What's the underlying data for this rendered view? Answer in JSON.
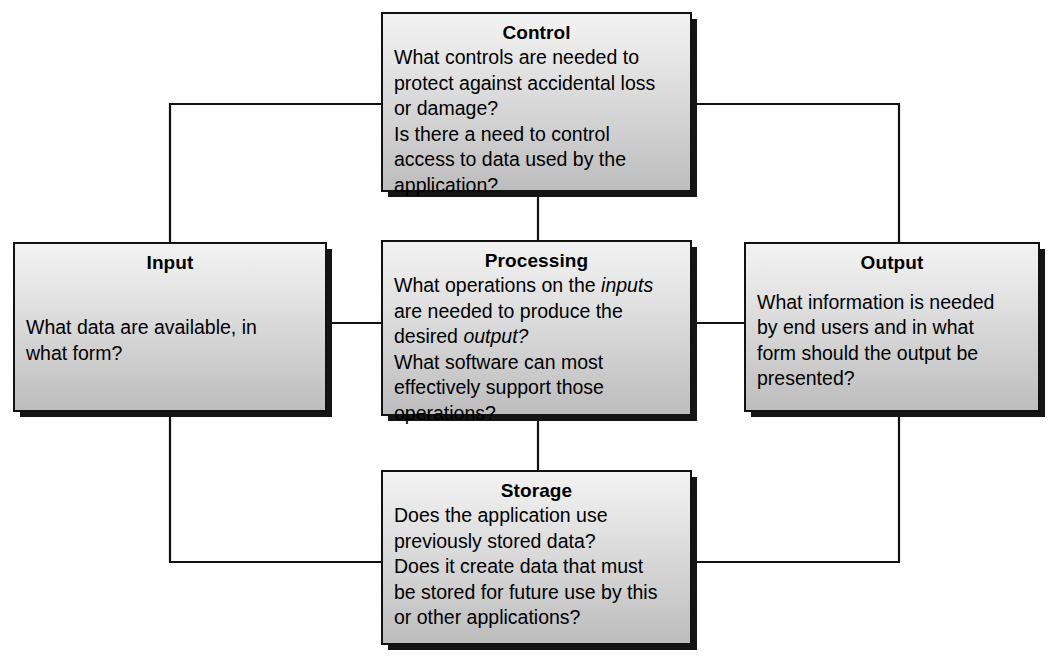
{
  "diagram": {
    "nodes": [
      {
        "id": "control",
        "title": "Control",
        "lines": [
          "What controls are needed to",
          "protect against accidental loss",
          "or damage?",
          "Is there a need to control",
          "access to data used by the",
          "application?"
        ],
        "text": "What controls are needed to\nprotect against accidental loss\nor damage?\nIs there a need to control\naccess to data used by the\napplication?"
      },
      {
        "id": "input",
        "title": "Input",
        "lines": [
          "What data are available, in",
          "what form?"
        ],
        "text": "What data are available, in\nwhat form?"
      },
      {
        "id": "processing",
        "title": "Processing",
        "lines": [
          "What operations on the inputs",
          "are needed to produce the",
          "desired output?",
          "What software can most",
          "effectively support those",
          "operations?"
        ],
        "text": "What operations on the inputs\nare needed to produce the\ndesired output?\nWhat software can most\neffectively support those\noperations?",
        "italic_words": [
          "inputs",
          "output"
        ]
      },
      {
        "id": "output",
        "title": "Output",
        "lines": [
          "What information is needed",
          "by end users and in what",
          "form should the output be",
          "presented?"
        ],
        "text": "What information is needed\nby end users and in what\nform should the output be\npresented?"
      },
      {
        "id": "storage",
        "title": "Storage",
        "lines": [
          "Does the application use",
          "previously stored data?",
          "Does it create data that must",
          "be stored for future use by this",
          "or other applications?"
        ],
        "text": "Does the application use\npreviously stored data?\nDoes it create data that must\nbe stored for future use by this\nor other applications?"
      }
    ],
    "connections": [
      {
        "from": "control",
        "to": "processing"
      },
      {
        "from": "input",
        "to": "processing"
      },
      {
        "from": "processing",
        "to": "output"
      },
      {
        "from": "processing",
        "to": "storage"
      },
      {
        "from": "control",
        "to": "input"
      },
      {
        "from": "control",
        "to": "output"
      },
      {
        "from": "input",
        "to": "storage"
      },
      {
        "from": "output",
        "to": "storage"
      }
    ],
    "colors": {
      "line": "#111111",
      "border": "#111111",
      "shadow": "#141414",
      "fill_top": "#f2f2f2",
      "fill_bottom": "#bdbdbd",
      "background": "#ffffff",
      "text": "#000000"
    }
  }
}
